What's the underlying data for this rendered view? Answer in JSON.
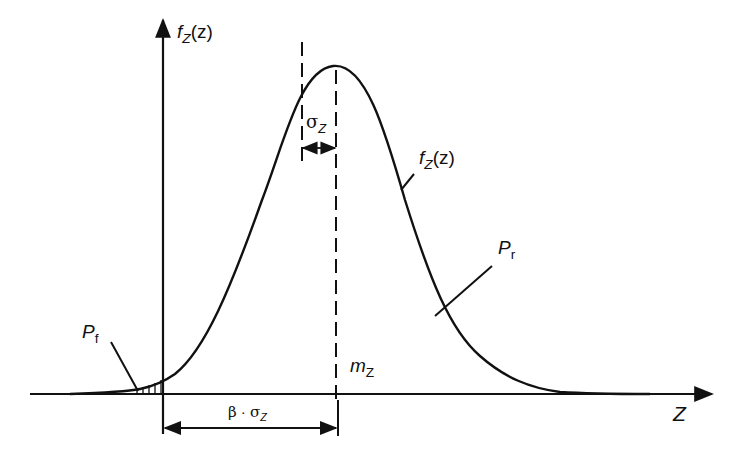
{
  "diagram": {
    "type": "normal-distribution-reliability",
    "colors": {
      "ink": "#111111",
      "background": "#ffffff"
    },
    "axes": {
      "x_label": {
        "main": "Z",
        "sub": ""
      },
      "y_label": {
        "main": "f",
        "sub": "Z",
        "arg": "(z)"
      }
    },
    "curve_label": {
      "main": "f",
      "sub": "Z",
      "arg": "(z)"
    },
    "annotations": {
      "sigma": {
        "main": "σ",
        "sub": "Z"
      },
      "mean": {
        "main": "m",
        "sub": "Z"
      },
      "failure_prob": {
        "main": "P",
        "sub": "f"
      },
      "reliability": {
        "main": "P",
        "sub": "r"
      },
      "distance": {
        "beta": "β",
        "dot": "·",
        "sigma": "σ",
        "sub": "Z"
      }
    }
  }
}
